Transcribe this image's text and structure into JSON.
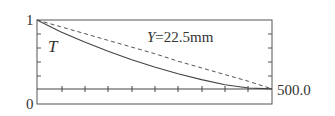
{
  "chart_data": {
    "type": "line",
    "title": "",
    "xlabel": "",
    "ylabel": "",
    "ylim": [
      0,
      1
    ],
    "y_tick_labels": [
      "0",
      "1"
    ],
    "right_label": "500.0",
    "reference_line_value": 0.18,
    "annotation": "Y=22.5mm",
    "curve_label": "T",
    "grid": false,
    "x": [
      0,
      0.1,
      0.2,
      0.3,
      0.4,
      0.5,
      0.6,
      0.7,
      0.8,
      0.9,
      1.0
    ],
    "series": [
      {
        "name": "T (solid)",
        "style": "solid",
        "values": [
          1.0,
          0.86,
          0.74,
          0.63,
          0.53,
          0.44,
          0.36,
          0.29,
          0.23,
          0.19,
          0.18
        ]
      },
      {
        "name": "dashed",
        "style": "dashed",
        "values": [
          1.0,
          0.92,
          0.84,
          0.76,
          0.68,
          0.6,
          0.51,
          0.43,
          0.35,
          0.27,
          0.18
        ]
      }
    ]
  },
  "labels": {
    "y_top": "1",
    "y_bottom": "0",
    "right_value": "500.0",
    "annotation": "Y=22.5mm",
    "annotation_var": "Y",
    "annotation_rest": "=22.5mm",
    "curve": "T"
  }
}
